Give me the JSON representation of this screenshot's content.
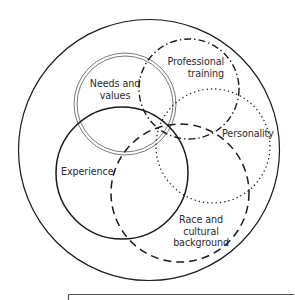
{
  "diagram": {
    "title": "",
    "colors": {
      "stroke": "#1a1a1a",
      "background": "#ffffff",
      "text": "#2a2a2a"
    },
    "outer_circle": {
      "cx": 149,
      "cy": 150,
      "r": 130,
      "style": "solid"
    },
    "circles": [
      {
        "id": "needs-and-values",
        "label_lines": [
          "Needs and",
          "values"
        ],
        "cx": 125,
        "cy": 104,
        "r": 51,
        "style": "double"
      },
      {
        "id": "professional-training",
        "label_lines": [
          "Professional",
          "training"
        ],
        "cx": 189,
        "cy": 89,
        "r": 50,
        "style": "dash-dot"
      },
      {
        "id": "personality",
        "label_lines": [
          "Personality"
        ],
        "cx": 213,
        "cy": 146,
        "r": 57,
        "style": "dotted"
      },
      {
        "id": "experience",
        "label_lines": [
          "Experience"
        ],
        "cx": 122,
        "cy": 173,
        "r": 66,
        "style": "solid"
      },
      {
        "id": "race-and-cultural-background",
        "label_lines": [
          "Race and",
          "cultural",
          "background"
        ],
        "cx": 180,
        "cy": 193,
        "r": 69,
        "style": "dashed"
      }
    ],
    "labels": {
      "needs_line1": "Needs and",
      "needs_line2": "values",
      "professional_line1": "Professional",
      "professional_line2": "training",
      "personality": "Personality",
      "experience": "Experience",
      "race_line1": "Race and",
      "race_line2": "cultural",
      "race_line3": "background"
    },
    "footer_rule": {
      "x1": 68,
      "x2": 294,
      "y": 294
    }
  }
}
